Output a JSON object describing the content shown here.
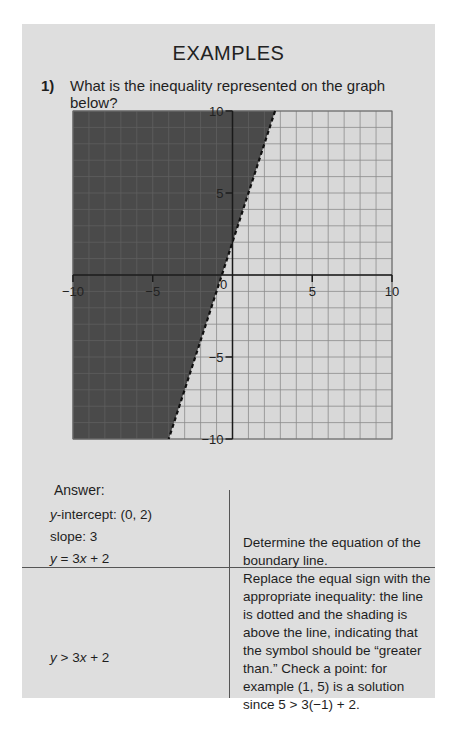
{
  "header": {
    "title": "EXAMPLES"
  },
  "question": {
    "number": "1)",
    "text": "What is the inequality represented on the graph below?"
  },
  "chart_data": {
    "type": "inequality-graph",
    "title": "",
    "xlim": [
      -10,
      10
    ],
    "ylim": [
      -10,
      10
    ],
    "grid": true,
    "grid_step": 1,
    "x_tick_labels": [
      "-10",
      "-5",
      "0",
      "5",
      "10"
    ],
    "y_tick_labels": [
      "10",
      "5",
      "-5",
      "-10"
    ],
    "origin_label": "0",
    "boundary_line": {
      "equation": "y = 3x + 2",
      "slope": 3,
      "intercept": 2,
      "style": "dashed"
    },
    "shaded_region": "above line (left side)",
    "colors": {
      "shaded": "#4a4a4a",
      "unshaded": "#d8d8d8",
      "grid_light": "#8c8c8c",
      "grid_dark": "#606060",
      "axis": "#1a1a1a"
    }
  },
  "answer": {
    "label": "Answer:",
    "rows": [
      {
        "left": [
          "y-intercept: (0, 2)",
          "slope: 3",
          "y = 3x + 2"
        ],
        "right": "Determine the equation of the boundary line."
      },
      {
        "left": [
          "y > 3x + 2"
        ],
        "right": "Replace the equal sign with the appropriate inequality: the line is dotted and the shading is above the line, indicating that the symbol should be “greater than.” Check a point: for example (1, 5) is a solution since 5 > 3(−1) + 2."
      }
    ]
  }
}
